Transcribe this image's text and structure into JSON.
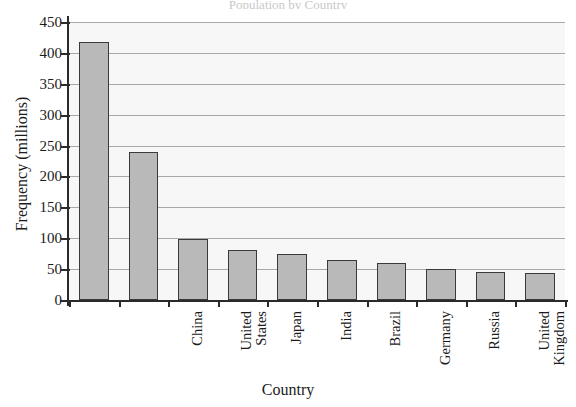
{
  "figure": {
    "title_remnant": "Population by Country",
    "background_color": "#ffffff",
    "plot_background_color": "#f7f7f7",
    "bar_fill_color": "#b9b9b9",
    "bar_border_color": "#3a3a3a",
    "gridline_color": "#a9a9a9",
    "axis_color": "#2a2a2a",
    "text_color": "#1b1b1b"
  },
  "chart_data": {
    "type": "bar",
    "title": "",
    "xlabel": "Country",
    "ylabel": "Frequency (millions)",
    "categories": [
      "China",
      "United States",
      "Japan",
      "India",
      "Brazil",
      "Germany",
      "Russia",
      "United Kingdom",
      "France",
      "Nigeria"
    ],
    "values": [
      418,
      240,
      99,
      81,
      75,
      64,
      60,
      51,
      45,
      44
    ],
    "ylim": [
      0,
      450
    ],
    "ytick_values": [
      0,
      50,
      100,
      150,
      200,
      250,
      300,
      350,
      400,
      450
    ],
    "ytick_labels": [
      "0",
      "50",
      "100",
      "150",
      "200",
      "250",
      "300",
      "350",
      "400",
      "450"
    ],
    "grid": true,
    "grid_axis": "y",
    "legend": false,
    "legend_position": "none",
    "bar_orientation": "vertical",
    "series": [
      {
        "name": "Frequency (millions)",
        "values": [
          418,
          240,
          99,
          81,
          75,
          64,
          60,
          51,
          45,
          44
        ]
      }
    ]
  }
}
